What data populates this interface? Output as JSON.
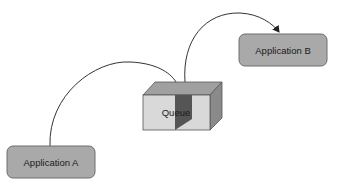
{
  "diagram": {
    "nodes": {
      "app_a": {
        "label": "Application A",
        "fill": "#a9a9a9"
      },
      "queue": {
        "label": "Queue",
        "front_fill": "#d9d9d9",
        "top_fill": "#a0a0a0",
        "side_fill": "#8a8a8a",
        "divider_fill": "#555555"
      },
      "app_b": {
        "label": "Application B",
        "fill": "#a9a9a9"
      }
    },
    "edges": [
      {
        "from": "Application A",
        "to": "Queue",
        "arrow": false
      },
      {
        "from": "Queue",
        "to": "Application B",
        "arrow": true
      }
    ],
    "colors": {
      "stroke": "#333333",
      "background": "#ffffff"
    }
  }
}
